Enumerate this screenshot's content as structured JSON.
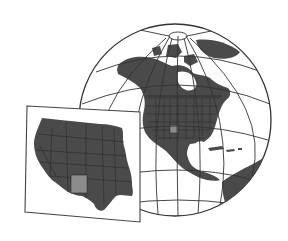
{
  "figure": {
    "description": "Orthographic globe of North America with US state boundaries, plus a flat inset map of the western/central United States with one state highlighted",
    "globe": {
      "center": [
        175,
        120
      ],
      "radius": 96,
      "highlighted_state": "New Mexico"
    },
    "inset": {
      "region": "Western and central United States",
      "highlighted_state": "New Mexico"
    },
    "colors": {
      "land": "#4a4a4a",
      "highlight": "#8c8c8c",
      "ocean": "#ffffff",
      "graticule": "#333333",
      "border": "#2a2a2a",
      "frame": "#444444"
    }
  }
}
